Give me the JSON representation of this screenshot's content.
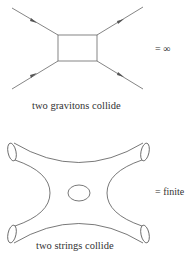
{
  "graviton_diagram": {
    "result_label": "= ∞",
    "caption": "two gravitons collide"
  },
  "string_diagram": {
    "result_label": "= finite",
    "caption": "two strings collide"
  },
  "colors": {
    "stroke": "#555555",
    "text": "#333333",
    "background": "#ffffff"
  }
}
